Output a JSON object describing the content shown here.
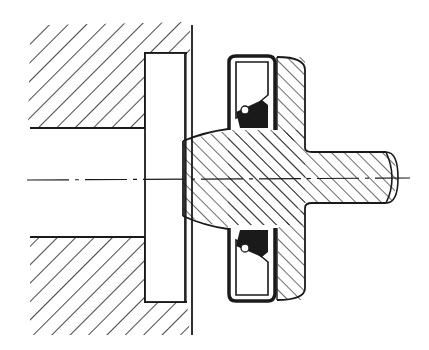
{
  "figure": {
    "type": "technical-cross-section",
    "line_color": "#1a1a1a",
    "background": "#ffffff",
    "hatch_style": "45-degree diagonal section hatching",
    "components": [
      {
        "id": "housing-upper",
        "label": "Housing (upper section)"
      },
      {
        "id": "housing-lower",
        "label": "Housing (lower section)"
      },
      {
        "id": "cover-plate",
        "label": "Cover plate / spacer"
      },
      {
        "id": "shaft-hub",
        "label": "Shaft hub with flange"
      },
      {
        "id": "seal-upper",
        "label": "Radial shaft seal (upper)"
      },
      {
        "id": "seal-lower",
        "label": "Radial shaft seal (lower)"
      },
      {
        "id": "centerline",
        "label": "Axis centerline"
      }
    ]
  }
}
